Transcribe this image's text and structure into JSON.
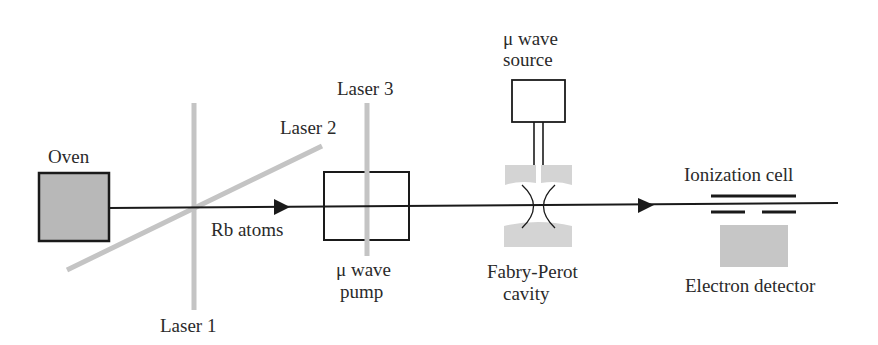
{
  "diagram": {
    "colors": {
      "line": "#1a1a1a",
      "laser": "#c4c4c4",
      "fill_gray": "#b8b8b8",
      "fill_light": "#d4d4d4",
      "background": "#ffffff"
    },
    "labels": {
      "oven": "Oven",
      "rb_atoms": "Rb atoms",
      "laser1": "Laser 1",
      "laser2": "Laser 2",
      "laser3": "Laser 3",
      "pump_line1": "μ wave",
      "pump_line2": "pump",
      "source_line1": "μ wave",
      "source_line2": "source",
      "cavity_line1": "Fabry-Perot",
      "cavity_line2": "cavity",
      "ionization_cell": "Ionization cell",
      "electron_detector": "Electron detector"
    },
    "components": [
      {
        "id": "oven",
        "label": "Oven"
      },
      {
        "id": "laser1",
        "label": "Laser 1"
      },
      {
        "id": "laser2",
        "label": "Laser 2"
      },
      {
        "id": "microwave-pump",
        "label": "μ wave pump"
      },
      {
        "id": "laser3",
        "label": "Laser 3"
      },
      {
        "id": "microwave-source",
        "label": "μ wave source"
      },
      {
        "id": "fabry-perot-cavity",
        "label": "Fabry-Perot cavity"
      },
      {
        "id": "ionization-cell",
        "label": "Ionization cell"
      },
      {
        "id": "electron-detector",
        "label": "Electron detector"
      }
    ],
    "beam": {
      "label": "Rb atoms",
      "direction": "left-to-right"
    }
  }
}
